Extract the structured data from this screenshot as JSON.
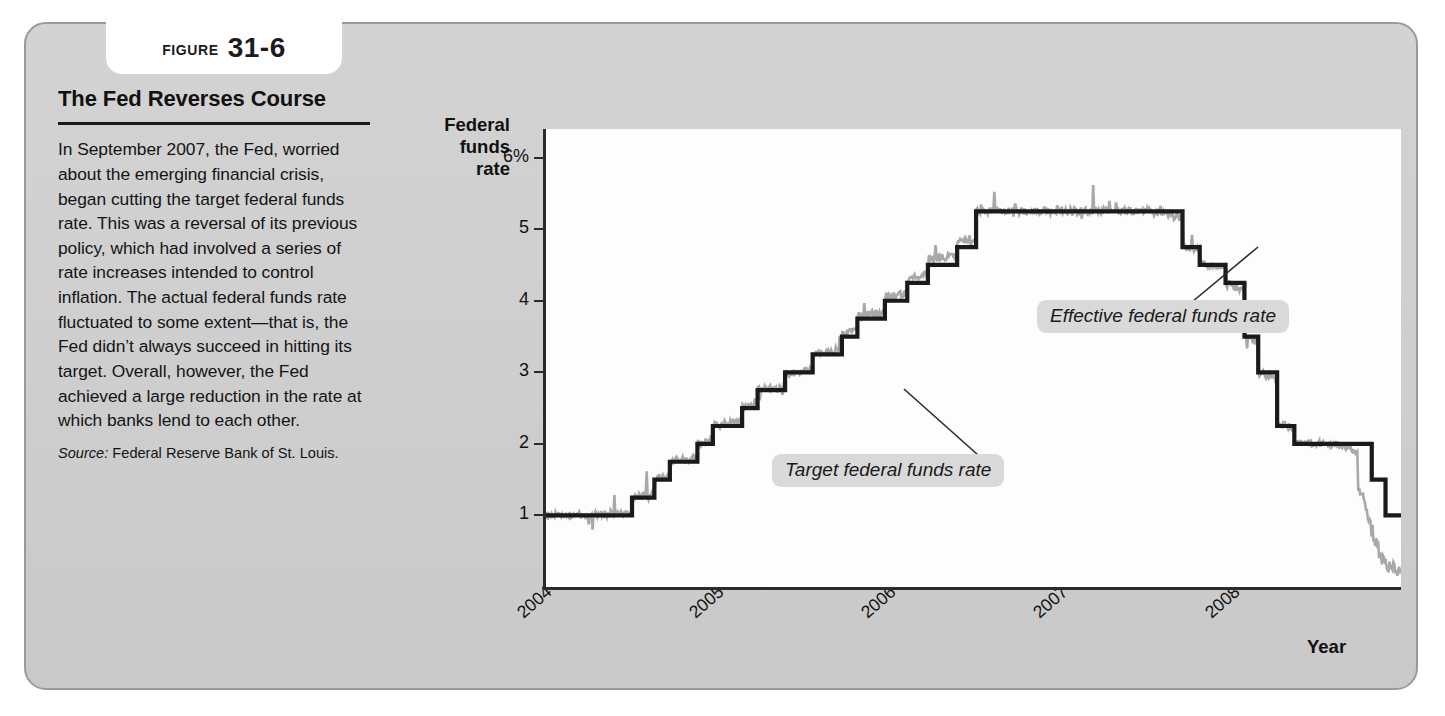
{
  "figure": {
    "label": "Figure",
    "number": "31-6"
  },
  "caption": {
    "title": "The Fed Reverses Course",
    "body": "In September 2007, the Fed, worried about the emerging financial crisis, began cutting the target federal funds rate. This was a reversal of its previous policy, which had involved a series of rate increases intended to control inflation. The actual federal funds rate fluctuated to some extent—that is, the Fed didn’t always succeed in hitting its target. Overall, however, the Fed achieved a large reduction in the rate at which banks lend to each other.",
    "source_label": "Source:",
    "source_text": "Federal Reserve Bank of St. Louis."
  },
  "chart_data": {
    "type": "line",
    "title": "",
    "ylabel": "Federal funds rate",
    "xlabel": "Year",
    "ylim": [
      0,
      6.4
    ],
    "xlim": [
      2004.0,
      2008.97
    ],
    "grid": false,
    "legend_position": "inline-annotations",
    "ytick_labels": [
      "6%",
      "5",
      "4",
      "3",
      "2",
      "1"
    ],
    "ytick_values": [
      6,
      5,
      4,
      3,
      2,
      1
    ],
    "xtick_labels": [
      "2004",
      "2005",
      "2006",
      "2007",
      "2008"
    ],
    "xtick_values": [
      2004,
      2005,
      2006,
      2007,
      2008
    ],
    "annotations": [
      {
        "text": "Effective federal funds rate",
        "points_to_series": "Effective federal funds rate"
      },
      {
        "text": "Target federal funds rate",
        "points_to_series": "Target federal funds rate"
      }
    ],
    "series": [
      {
        "name": "Target federal funds rate",
        "color": "#1a1a1a",
        "style": "step",
        "x": [
          2004.0,
          2004.5,
          2004.5,
          2004.63,
          2004.63,
          2004.72,
          2004.72,
          2004.88,
          2004.88,
          2004.97,
          2004.97,
          2005.14,
          2005.14,
          2005.23,
          2005.23,
          2005.39,
          2005.39,
          2005.55,
          2005.55,
          2005.72,
          2005.72,
          2005.81,
          2005.81,
          2005.97,
          2005.97,
          2006.1,
          2006.1,
          2006.22,
          2006.22,
          2006.39,
          2006.39,
          2006.5,
          2006.5,
          2007.7,
          2007.7,
          2007.8,
          2007.8,
          2007.95,
          2007.95,
          2008.06,
          2008.06,
          2008.14,
          2008.14,
          2008.25,
          2008.25,
          2008.35,
          2008.35,
          2008.8,
          2008.8,
          2008.88,
          2008.88,
          2008.97
        ],
        "y": [
          1.0,
          1.0,
          1.25,
          1.25,
          1.5,
          1.5,
          1.75,
          1.75,
          2.0,
          2.0,
          2.25,
          2.25,
          2.5,
          2.5,
          2.75,
          2.75,
          3.0,
          3.0,
          3.25,
          3.25,
          3.5,
          3.5,
          3.75,
          3.75,
          4.0,
          4.0,
          4.25,
          4.25,
          4.5,
          4.5,
          4.75,
          4.75,
          5.25,
          5.25,
          4.75,
          4.75,
          4.5,
          4.5,
          4.25,
          4.25,
          3.5,
          3.5,
          3.0,
          3.0,
          2.25,
          2.25,
          2.0,
          2.0,
          1.5,
          1.5,
          1.0,
          1.0
        ]
      },
      {
        "name": "Effective federal funds rate",
        "color": "#a8a8a8",
        "style": "noisy-line",
        "description": "Actual market rate tracking the target closely with small fluctuations, spiking and dipping around target changes, and falling sharply below target to near 0.2% at the end of 2008",
        "x": [
          2004.0,
          2004.25,
          2004.5,
          2004.75,
          2005.0,
          2005.25,
          2005.5,
          2005.75,
          2006.0,
          2006.25,
          2006.5,
          2006.75,
          2007.0,
          2007.25,
          2007.5,
          2007.7,
          2007.85,
          2008.0,
          2008.15,
          2008.3,
          2008.45,
          2008.6,
          2008.75,
          2008.85,
          2008.95
        ],
        "y": [
          1.0,
          1.0,
          1.26,
          1.76,
          2.28,
          2.78,
          3.0,
          3.78,
          4.29,
          4.99,
          5.25,
          5.25,
          5.26,
          5.25,
          5.26,
          4.7,
          4.5,
          4.0,
          2.9,
          2.2,
          2.0,
          2.0,
          1.2,
          0.4,
          0.2
        ]
      }
    ]
  }
}
